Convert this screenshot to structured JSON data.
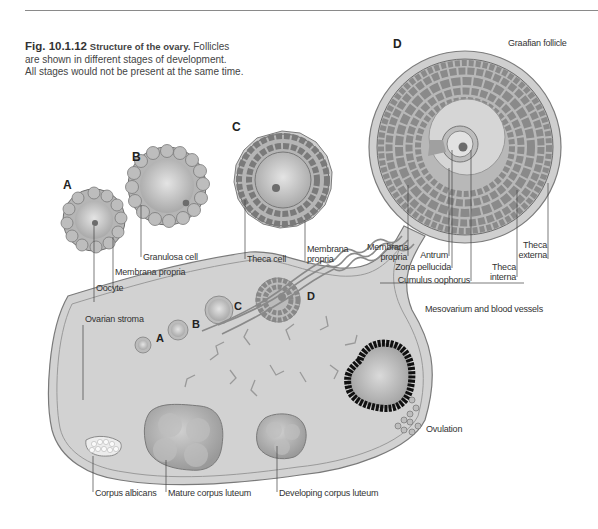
{
  "figure": {
    "number": "Fig. 10.1.12",
    "title": "Structure of the ovary.",
    "caption_line1": "Follicles",
    "caption_line2": "are shown in different stages of development.",
    "caption_line3": "All stages would not be present at the same time."
  },
  "stages": {
    "A": "A",
    "B": "B",
    "C": "C",
    "D": "D"
  },
  "labels": {
    "graafian_follicle": "Graafian follicle",
    "granulosa_cell": "Granulosa cell",
    "membrana_propria_a": "Membrana propria",
    "oocyte": "Oocyte",
    "theca_cell": "Theca cell",
    "membrana_propria_c_1": "Membrana",
    "membrana_propria_c_2": "propria",
    "membrana_propria_d_1": "Membrana",
    "membrana_propria_d_2": "propria",
    "antrum": "Antrum",
    "zona_pellucida": "Zona pellucida",
    "cumulus_oophorus": "Cumulus oophorus",
    "theca_interna_1": "Theca",
    "theca_interna_2": "interna",
    "theca_externa_1": "Theca",
    "theca_externa_2": "externa",
    "mesovarium": "Mesovarium and blood vessels",
    "ovarian_stroma": "Ovarian stroma",
    "ovulation": "Ovulation",
    "corpus_albicans": "Corpus albicans",
    "mature_corpus_luteum": "Mature corpus luteum",
    "developing_corpus_luteum": "Developing corpus luteum"
  },
  "colors": {
    "cell_fill": "#b8b8b8",
    "cell_stroke": "#6e6e6e",
    "stroma": "#d2d2d2",
    "oocyte": "#c9c9c9",
    "ruptured_follicle": "#111111",
    "text": "#333333"
  }
}
